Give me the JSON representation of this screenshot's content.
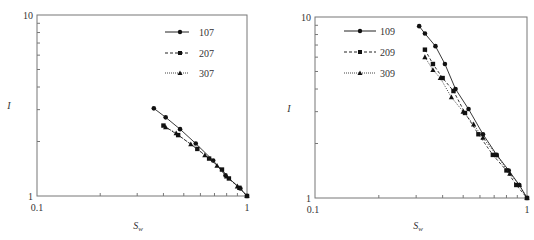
{
  "chart_data": [
    {
      "type": "line",
      "title": "",
      "xlabel": "S_w",
      "ylabel": "I",
      "xscale": "log",
      "yscale": "log",
      "xlim": [
        0.1,
        1
      ],
      "ylim": [
        1,
        10
      ],
      "xticks": [
        "0.1",
        "1"
      ],
      "yticks": [
        "1",
        "10"
      ],
      "grid": false,
      "legend_position": "upper right",
      "series": [
        {
          "name": "107",
          "marker": "circle",
          "linestyle": "solid",
          "x": [
            0.36,
            0.41,
            0.48,
            0.57,
            0.69,
            0.79,
            0.93,
            1.0
          ],
          "y": [
            3.05,
            2.72,
            2.34,
            1.95,
            1.57,
            1.3,
            1.1,
            1.0
          ]
        },
        {
          "name": "207",
          "marker": "square",
          "linestyle": "dashed",
          "x": [
            0.4,
            0.47,
            0.58,
            0.66,
            0.76,
            0.82,
            0.92,
            1.0
          ],
          "y": [
            2.45,
            2.17,
            1.82,
            1.61,
            1.4,
            1.25,
            1.11,
            1.0
          ]
        },
        {
          "name": "307",
          "marker": "triangle",
          "linestyle": "dotted",
          "x": [
            0.41,
            0.46,
            0.54,
            0.63,
            0.72,
            0.8,
            0.9,
            1.0
          ],
          "y": [
            2.4,
            2.22,
            1.93,
            1.68,
            1.47,
            1.28,
            1.13,
            1.0
          ]
        }
      ]
    },
    {
      "type": "line",
      "title": "",
      "xlabel": "S_w",
      "ylabel": "I",
      "xscale": "log",
      "yscale": "log",
      "xlim": [
        0.1,
        1
      ],
      "ylim": [
        1,
        10
      ],
      "xticks": [
        "0.1",
        "1"
      ],
      "yticks": [
        "1",
        "10"
      ],
      "grid": false,
      "legend_position": "upper left",
      "series": [
        {
          "name": "109",
          "marker": "circle",
          "linestyle": "solid",
          "x": [
            0.31,
            0.33,
            0.37,
            0.41,
            0.46,
            0.53,
            0.62,
            0.72,
            0.82,
            0.92,
            1.0
          ],
          "y": [
            8.9,
            8.1,
            6.9,
            5.5,
            4.0,
            3.1,
            2.25,
            1.73,
            1.42,
            1.18,
            1.0
          ]
        },
        {
          "name": "209",
          "marker": "square",
          "linestyle": "dashed",
          "x": [
            0.33,
            0.36,
            0.4,
            0.45,
            0.51,
            0.59,
            0.69,
            0.8,
            0.89,
            1.0
          ],
          "y": [
            6.6,
            5.5,
            4.6,
            3.9,
            2.95,
            2.25,
            1.73,
            1.42,
            1.18,
            1.0
          ]
        },
        {
          "name": "309",
          "marker": "triangle",
          "linestyle": "dotted",
          "x": [
            0.33,
            0.36,
            0.39,
            0.44,
            0.5,
            0.56,
            0.62,
            0.72,
            0.83,
            0.92,
            1.0
          ],
          "y": [
            6.0,
            5.1,
            4.6,
            3.6,
            3.0,
            2.55,
            2.15,
            1.72,
            1.36,
            1.18,
            1.0
          ]
        }
      ]
    }
  ],
  "charts": [
    {
      "ylabel": "I",
      "xlabel_main": "S",
      "xlabel_sub": "w",
      "tick_y_top": "10",
      "tick_y_bottom": "1",
      "tick_x_left": "0.1",
      "tick_x_right": "1",
      "legend": [
        "107",
        "207",
        "307"
      ]
    },
    {
      "ylabel": "I",
      "xlabel_main": "S",
      "xlabel_sub": "w",
      "tick_y_top": "10",
      "tick_y_bottom": "1",
      "tick_x_left": "0.1",
      "tick_x_right": "1",
      "legend": [
        "109",
        "209",
        "309"
      ]
    }
  ]
}
